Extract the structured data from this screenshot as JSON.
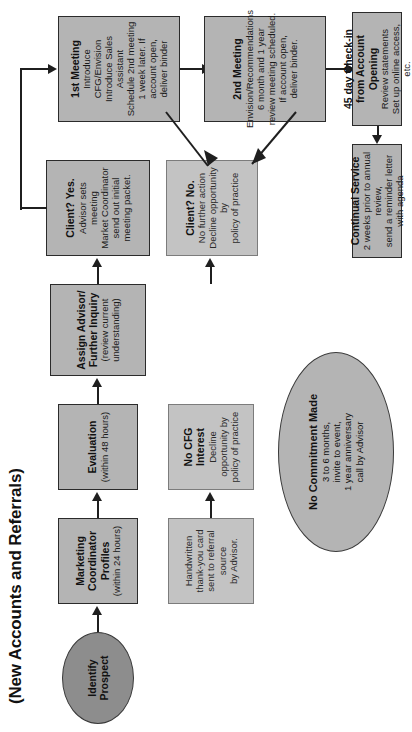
{
  "title": "(New Accounts and Referrals)",
  "nodes": {
    "identify_prospect": {
      "heading": "Identify Prospect"
    },
    "marketing_coordinator": {
      "heading": "Marketing Coordinator\nProfiles",
      "body": "(within 24 hours)"
    },
    "thank_you_card": {
      "body": "Handwritten thank-you card\nsent to referral source\nby Advisor."
    },
    "evaluation": {
      "heading": "Evaluation",
      "body": "(within 48 hours)"
    },
    "no_cfg_interest": {
      "heading": "No CFG Interest",
      "body": "Decline opportunity by\npolicy of practice"
    },
    "assign_advisor": {
      "heading": "Assign Advisor/\nFurther Inquiry",
      "body": "(review current understanding)"
    },
    "client_no": {
      "heading": "Client? No.",
      "body": "No further action\nDecline opportunity by\npolicy of practice"
    },
    "client_yes": {
      "heading": "Client? Yes.",
      "body": "Advisor sets meeting\nMarket Coordinator\nsend out initial meeting packet."
    },
    "first_meeting": {
      "heading": "1st Meeting",
      "body": "Introduce CFG/Envision\nIntroduce Sales Assistant\nSchedule 2nd meeting\n1 week later. If account open,\ndeliver binder"
    },
    "second_meeting": {
      "heading": "2nd Meeting",
      "body": "Envision/Recommendations\n6 month and 1 year\nreview meeting scheduled.\nIf account open,\ndeliver binder."
    },
    "check_in_45": {
      "heading": "45 day Check-in\nfrom Account Opening",
      "body": "Review statements\nSet up online access, etc."
    },
    "continual_service": {
      "heading": "Continual Service",
      "body": "2 weeks prior to annual review,\nsend a reminder letter\nwith agenda"
    },
    "no_commitment": {
      "heading": "No Commitment Made",
      "body": "3 to 6 months,\ninvite to event,\n1 year anniversary\ncall by Advisor"
    }
  },
  "colors": {
    "node_fill": "#b4b4b4",
    "node_plain_fill": "#c3c3c3",
    "ellipse_dark_fill": "#8d8d8d",
    "stroke": "#2b2b2b",
    "connector": "#1f1f1f",
    "background": "#ffffff"
  }
}
